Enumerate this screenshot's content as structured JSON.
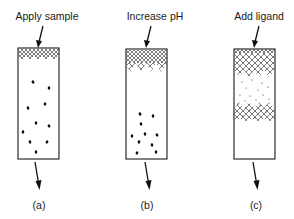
{
  "figure": {
    "panels": [
      {
        "id": "a",
        "instruction": "Apply sample",
        "caption": "(a)",
        "column": {
          "x": 18,
          "y": 48,
          "w": 41,
          "h": 111
        },
        "hatch_bands": [
          {
            "y0": 49,
            "y1": 60,
            "style": "dense-zigzag-bottom"
          }
        ],
        "particles": [
          [
            33,
            82
          ],
          [
            49,
            88
          ],
          [
            28,
            108
          ],
          [
            45,
            104
          ],
          [
            36,
            123
          ],
          [
            49,
            126
          ],
          [
            23,
            132
          ],
          [
            30,
            142
          ],
          [
            47,
            142
          ],
          [
            36,
            152
          ]
        ],
        "fine_dots": []
      },
      {
        "id": "b",
        "instruction": "Increase pH",
        "caption": "(b)",
        "column": {
          "x": 126,
          "y": 49,
          "w": 41,
          "h": 110
        },
        "hatch_bands": [
          {
            "y0": 50,
            "y1": 72,
            "style": "dense-top-loose-bottom"
          }
        ],
        "particles": [
          [
            140,
            114
          ],
          [
            153,
            116
          ],
          [
            141,
            124
          ],
          [
            132,
            136
          ],
          [
            145,
            134
          ],
          [
            157,
            135
          ],
          [
            139,
            142
          ],
          [
            152,
            145
          ],
          [
            137,
            153
          ],
          [
            156,
            152
          ]
        ],
        "fine_dots": []
      },
      {
        "id": "c",
        "instruction": "Add ligand",
        "caption": "(c)",
        "column": {
          "x": 234,
          "y": 49,
          "w": 41,
          "h": 110
        },
        "hatch_bands": [
          {
            "y0": 49,
            "y1": 53,
            "style": "solid-thin"
          },
          {
            "y0": 53,
            "y1": 77,
            "style": "crosshatch-zigzag-bottom"
          },
          {
            "y0": 102,
            "y1": 121,
            "style": "crosshatch-zigzag-top"
          }
        ],
        "particles": [],
        "fine_dots": [
          [
            242,
            82
          ],
          [
            252,
            80
          ],
          [
            262,
            83
          ],
          [
            246,
            88
          ],
          [
            258,
            90
          ],
          [
            268,
            87
          ],
          [
            240,
            95
          ],
          [
            250,
            96
          ],
          [
            263,
            95
          ],
          [
            245,
            101
          ],
          [
            256,
            100
          ],
          [
            269,
            99
          ],
          [
            238,
            104
          ],
          [
            260,
            106
          ],
          [
            250,
            110
          ],
          [
            266,
            112
          ],
          [
            243,
            116
          ],
          [
            255,
            118
          ]
        ]
      }
    ]
  }
}
